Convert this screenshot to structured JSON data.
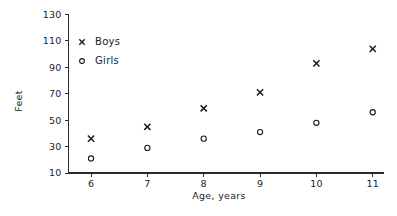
{
  "chart_data": {
    "type": "scatter",
    "title": "",
    "xlabel": "Age, years",
    "ylabel": "Feet",
    "x": [
      6,
      7,
      8,
      9,
      10,
      11
    ],
    "xlim": [
      5.6,
      11.2
    ],
    "ylim": [
      10,
      130
    ],
    "xticks": [
      6,
      7,
      8,
      9,
      10,
      11
    ],
    "xticklabels": [
      "6",
      "7",
      "8",
      "9",
      "10",
      "11"
    ],
    "yticks": [
      10,
      30,
      50,
      70,
      90,
      110,
      130
    ],
    "yticklabels": [
      "10",
      "30",
      "50",
      "70",
      "90",
      "110",
      "130"
    ],
    "grid": false,
    "legend_position": "upper left inside",
    "series": [
      {
        "name": "Boys",
        "marker": "x",
        "color": "#1a1a1a",
        "values": [
          36,
          45,
          59,
          71,
          93,
          104
        ]
      },
      {
        "name": "Girls",
        "marker": "o",
        "color": "#1a1a1a",
        "values": [
          21,
          29,
          36,
          41,
          48,
          56
        ]
      }
    ]
  },
  "legend": {
    "entries": [
      {
        "label": "Boys",
        "marker": "x"
      },
      {
        "label": "Girls",
        "marker": "o"
      }
    ]
  }
}
